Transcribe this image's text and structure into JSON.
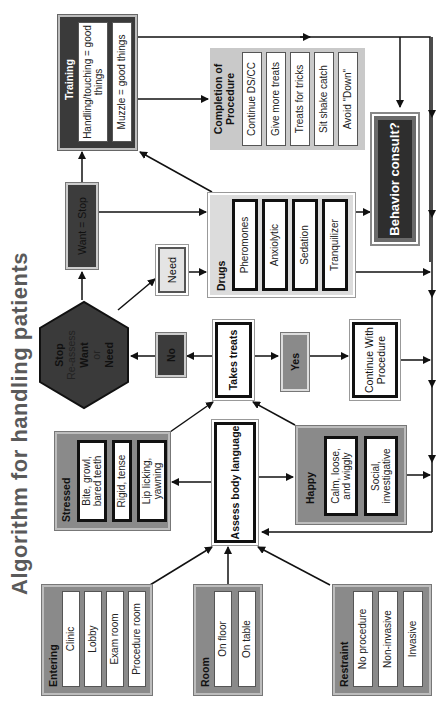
{
  "title": "Algorithm for handling patients",
  "entering": {
    "header": "Entering",
    "items": [
      "Clinic",
      "Lobby",
      "Exam room",
      "Procedure room"
    ]
  },
  "room": {
    "header": "Room",
    "items": [
      "On floor",
      "On table"
    ]
  },
  "restraint": {
    "header": "Restraint",
    "items": [
      "No procedure",
      "Non-invasive",
      "Invasive"
    ]
  },
  "stressed": {
    "header": "Stressed",
    "items": [
      "Bite, growl, bared teeth",
      "Rigid, tense",
      "Lip licking, yawning"
    ]
  },
  "assess": {
    "label": "Assess body language"
  },
  "happy": {
    "header": "Happy",
    "items": [
      "Calm, loose, and wiggly",
      "Social, investigative"
    ]
  },
  "stop_node": {
    "line1": "Stop",
    "line2": "Re-assess",
    "line3": "Want",
    "line4": "or",
    "line5": "Need"
  },
  "no_label": "No",
  "takes_treats": "Takes treats",
  "yes_label": "Yes",
  "continue_procedure": "Continue With Procedure",
  "need_label": "Need",
  "want_stop": "Want = Stop",
  "drugs": {
    "header": "Drugs",
    "items": [
      "Pheromones",
      "Anxiolytic",
      "Sedation",
      "Tranquilizer"
    ]
  },
  "training": {
    "header": "Training",
    "items": [
      "Handling/touching = good things",
      "Muzzle = good things"
    ]
  },
  "completion": {
    "header": "Completion of Procedure",
    "items": [
      "Continue DS/CC",
      "Give more treats",
      "Treats for tricks",
      "Sit shake catch",
      "Avoid \"Down\""
    ]
  },
  "behavior_consult": "Behavior consult?",
  "colors": {
    "dark": "#3a3a3a",
    "mid_gray": "#8a8a8a",
    "light_gray": "#dcdcdc",
    "line": "#111111",
    "title": "#5a5a5a"
  }
}
